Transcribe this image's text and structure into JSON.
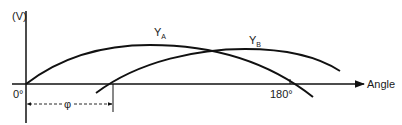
{
  "diagram": {
    "y_axis_label": "(V)",
    "x_axis_label": "Angle",
    "origin_label": "0°",
    "tick_180_label": "180°",
    "phase_label": "φ",
    "curve_a": {
      "label_main": "Y",
      "label_sub": "A"
    },
    "curve_b": {
      "label_main": "Y",
      "label_sub": "B"
    },
    "line_color": "#111111",
    "background": "#ffffff"
  }
}
